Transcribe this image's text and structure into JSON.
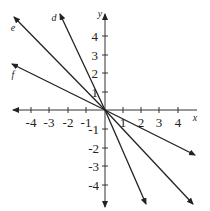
{
  "figure": {
    "type": "coordinate-plane",
    "axes": {
      "x_label": "x",
      "y_label": "y",
      "x_ticks": [
        "-4",
        "-3",
        "-2",
        "-1",
        "1",
        "2",
        "3",
        "4"
      ],
      "y_ticks": [
        "4",
        "3",
        "2",
        "1",
        "-1",
        "-2",
        "-3",
        "-4"
      ],
      "x_range": [
        -5,
        5
      ],
      "y_range": [
        -5,
        5
      ]
    },
    "lines": [
      {
        "label": "d",
        "slope_approx": -2.2,
        "through": [
          0,
          0
        ]
      },
      {
        "label": "e",
        "slope_approx": -1,
        "through": [
          0,
          0
        ]
      },
      {
        "label": "f",
        "slope_approx": -0.5,
        "through": [
          0,
          0
        ]
      }
    ],
    "colors": {
      "stroke": "#222222",
      "background": "#ffffff"
    }
  }
}
